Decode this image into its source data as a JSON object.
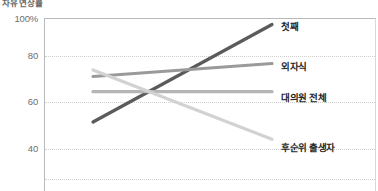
{
  "chart_data": {
    "type": "line",
    "title": "자유 연상률",
    "xlabel": "",
    "ylabel": "",
    "ylim": [
      30,
      100
    ],
    "yticks": [
      100,
      80,
      60,
      40
    ],
    "ytick_labels": [
      "100%",
      "80",
      "60",
      "40"
    ],
    "grid": "horizontal-dotted",
    "legend_position": "right-inline-labels",
    "x": [
      0,
      1
    ],
    "series": [
      {
        "name": "첫째",
        "values": [
          52,
          97
        ],
        "color": "#5b5b5b",
        "label": "첫째"
      },
      {
        "name": "외자식",
        "values": [
          73,
          79
        ],
        "color": "#9a9a9a",
        "label": "외자식"
      },
      {
        "name": "대의원 전체",
        "values": [
          66,
          66
        ],
        "color": "#b5b5b5",
        "label": "대의원 전체"
      },
      {
        "name": "후순위 출생자",
        "values": [
          76,
          44
        ],
        "color": "#d2d2d2",
        "label": "후순위 출생자"
      }
    ]
  },
  "title": {
    "text": "자유 연상률"
  },
  "axis": {
    "ticks": [
      {
        "label": "100%",
        "value": 100
      },
      {
        "label": "80",
        "value": 80
      },
      {
        "label": "60",
        "value": 60
      },
      {
        "label": "40",
        "value": 40
      }
    ]
  },
  "labels": {
    "first_born": "첫째",
    "only_child": "외자식",
    "all_delegates": "대의원 전체",
    "later_born": "후순위 출생자"
  }
}
